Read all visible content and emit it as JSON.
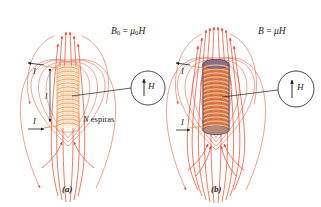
{
  "figure": {
    "caption_a": "(a)",
    "caption_b": "(b)",
    "colors": {
      "field_line": "#e08a76",
      "field_line_inner": "#e8573f",
      "coil_wire": "#e8954f",
      "coil_light": "#f7d9b0",
      "core_dark": "#6b5566",
      "core_fill": "#e2703a",
      "text": "#1a1a1a",
      "background": "#ffffff"
    }
  },
  "panel_a": {
    "field_equation": {
      "symbol": "B",
      "subscript": "0",
      "equals": " = ",
      "mu": "μ",
      "mu_subscript": "0",
      "h": "H",
      "full": "B0 = μ0H"
    },
    "current_top": "I",
    "current_bottom": "I",
    "length_label": "l",
    "turns_label_count": "N",
    "turns_label_word": "espiras",
    "inset": {
      "field_symbol": "H",
      "arrow_direction": "up"
    },
    "caption": "(a)"
  },
  "panel_b": {
    "field_equation": {
      "symbol": "B",
      "equals": " = ",
      "mu": "μ",
      "h": "H",
      "full": "B = μH"
    },
    "current_top": "I",
    "current_bottom": "I",
    "inset": {
      "field_symbol": "H",
      "arrow_direction": "up"
    },
    "caption": "(b)"
  }
}
